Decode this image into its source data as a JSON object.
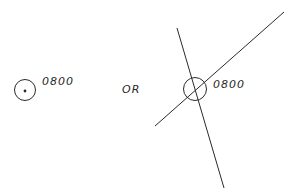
{
  "diagram": {
    "left_symbol": {
      "type": "circle-with-dot",
      "label": "0800"
    },
    "separator": "OR",
    "right_symbol": {
      "type": "circle-with-crossing-lines",
      "label": "0800"
    }
  },
  "colors": {
    "ink": "#2a2a2a",
    "background": "#ffffff"
  }
}
